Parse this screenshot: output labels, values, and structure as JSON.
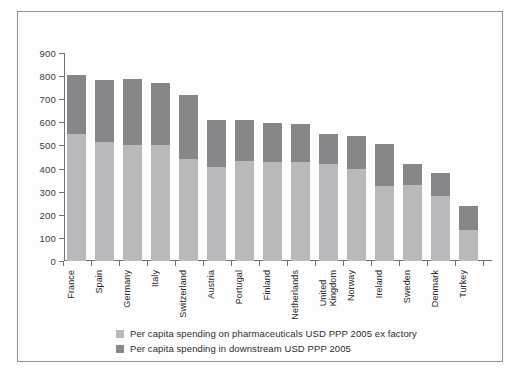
{
  "chart_data": {
    "type": "bar",
    "subtype": "stacked-bar",
    "title": "",
    "xlabel": "",
    "ylabel": "",
    "ylim": [
      0,
      900
    ],
    "ytick_step": 100,
    "yticks": [
      900,
      800,
      700,
      600,
      500,
      400,
      300,
      200,
      100,
      0
    ],
    "grid": false,
    "legend_position": "below-axis-left",
    "categories": [
      "France",
      "Spain",
      "Germany",
      "Italy",
      "Switzerland",
      "Austria",
      "Portugal",
      "Finland",
      "Netherlands",
      "United\nKingdom",
      "Norway",
      "Ireland",
      "Sweden",
      "Denmark",
      "Turkey"
    ],
    "series": [
      {
        "name": "Per capita spending on pharmaceuticals USD PPP 2005 ex factory",
        "color": "#b9b9bb",
        "values": [
          550,
          515,
          500,
          500,
          440,
          405,
          432,
          430,
          430,
          420,
          400,
          325,
          330,
          280,
          135
        ]
      },
      {
        "name": "Per capita spending in downstream USD PPP 2005",
        "color": "#87878a",
        "values": [
          255,
          270,
          287,
          270,
          280,
          207,
          180,
          168,
          165,
          130,
          140,
          180,
          90,
          100,
          105
        ]
      }
    ],
    "totals": [
      805,
      785,
      787,
      770,
      720,
      612,
      612,
      598,
      595,
      550,
      540,
      505,
      420,
      380,
      240
    ]
  },
  "legend": {
    "items": [
      {
        "label": "Per capita spending on pharmaceuticals USD PPP 2005 ex factory",
        "color": "#b9b9bb"
      },
      {
        "label": "Per capita spending in downstream USD PPP 2005",
        "color": "#87878a"
      }
    ]
  },
  "colors": {
    "pharmaceuticals": "#b9b9bb",
    "downstream": "#87878a",
    "axis": "#6f7276",
    "frame": "#8d9095",
    "background": "#ffffff"
  }
}
